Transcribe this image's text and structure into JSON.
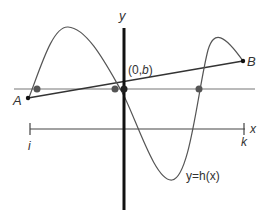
{
  "diagram": {
    "labels": {
      "y_axis": "y",
      "x_axis": "x",
      "point_A": "A",
      "point_B": "B",
      "intercept_open": "(0,",
      "intercept_b": "b",
      "intercept_close": ")",
      "tick_left": "i",
      "tick_right": "k",
      "curve": "y=h(x)"
    },
    "colors": {
      "curve": "#555555",
      "axis": "#111111",
      "line": "#666666",
      "dot": "#555555"
    }
  }
}
